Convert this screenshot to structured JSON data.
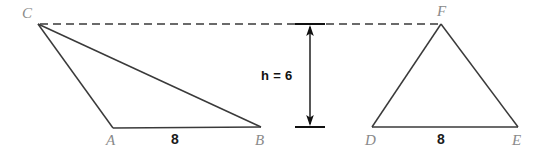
{
  "figure": {
    "background_color": "#ffffff",
    "stroke_color": "#3a3a3a",
    "label_color": "#8a8a8a",
    "measure_color": "#111111"
  },
  "left_triangle": {
    "name": "triangle-ABC",
    "vertices": {
      "C": {
        "label": "C",
        "x": 38,
        "y": 24
      },
      "A": {
        "label": "A",
        "x": 113,
        "y": 128
      },
      "B": {
        "label": "B",
        "x": 261,
        "y": 127
      }
    },
    "base_label": "8",
    "base_label_x": 175,
    "base_label_y": 134
  },
  "right_triangle": {
    "name": "triangle-DEF",
    "vertices": {
      "F": {
        "label": "F",
        "x": 441,
        "y": 24
      },
      "D": {
        "label": "D",
        "x": 372,
        "y": 127
      },
      "E": {
        "label": "E",
        "x": 518,
        "y": 127
      }
    },
    "base_label": "8",
    "base_label_x": 441,
    "base_label_y": 134
  },
  "height_annotation": {
    "label": "h = 6",
    "value": 6,
    "variable": "h",
    "top_y": 24,
    "bottom_y": 127,
    "arrow_x": 310,
    "tick_half_width": 15
  },
  "dashed_guide": {
    "name": "apex-alignment-line",
    "y": 24,
    "x_start": 40,
    "x_end": 441,
    "dash": "8 5"
  },
  "labels": {
    "C": "C",
    "A": "A",
    "B": "B",
    "F": "F",
    "D": "D",
    "E": "E"
  }
}
